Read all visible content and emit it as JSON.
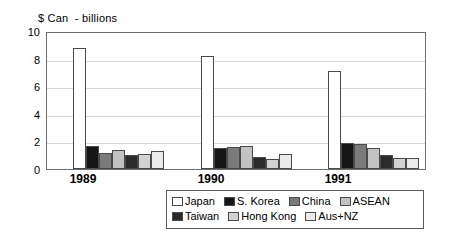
{
  "chart_data": {
    "type": "bar",
    "title": "$ Can  - billions",
    "xlabel": "",
    "ylabel": "$ Can - billions",
    "categories": [
      "1989",
      "1990",
      "1991"
    ],
    "ylim": [
      0,
      10
    ],
    "yticks": [
      "0",
      "2",
      "4",
      "6",
      "8",
      "10"
    ],
    "grid": true,
    "legend_position": "bottom",
    "series": [
      {
        "name": "Japan",
        "color": "#ffffff",
        "values": [
          8.9,
          8.3,
          7.2
        ]
      },
      {
        "name": "S. Korea",
        "color": "#151515",
        "values": [
          1.7,
          1.55,
          1.9
        ]
      },
      {
        "name": "China",
        "color": "#7a7a7a",
        "values": [
          1.2,
          1.65,
          1.85
        ]
      },
      {
        "name": "ASEAN",
        "color": "#c2c2c2",
        "values": [
          1.4,
          1.7,
          1.55
        ]
      },
      {
        "name": "Taiwan",
        "color": "#2a2a2a",
        "values": [
          1.0,
          0.85,
          1.05
        ]
      },
      {
        "name": "Hong Kong",
        "color": "#d2d2d2",
        "values": [
          1.1,
          0.7,
          0.8
        ]
      },
      {
        "name": "Aus+NZ",
        "color": "#eaeaea",
        "values": [
          1.3,
          1.1,
          0.8
        ]
      }
    ]
  },
  "legend": {
    "row1": [
      {
        "label": "Japan"
      },
      {
        "label": "S. Korea"
      },
      {
        "label": "China"
      },
      {
        "label": "ASEAN"
      }
    ],
    "row2": [
      {
        "label": "Taiwan"
      },
      {
        "label": "Hong Kong"
      },
      {
        "label": "Aus+NZ"
      }
    ]
  }
}
